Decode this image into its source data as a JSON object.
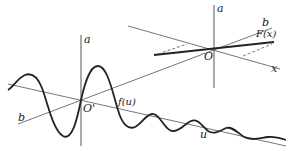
{
  "diagram": {
    "colors": {
      "line": "#555555",
      "curve": "#222222",
      "background": "#ffffff"
    },
    "upper_system": {
      "origin_label": "O",
      "vertical_axis_label": "a",
      "b_axis_label": "b",
      "x_axis_label": "x",
      "function_label": "F(x)"
    },
    "lower_system": {
      "origin_label": "O'",
      "vertical_axis_label": "a",
      "b_axis_label": "b",
      "u_axis_label": "u",
      "function_label": "f(u)"
    }
  }
}
